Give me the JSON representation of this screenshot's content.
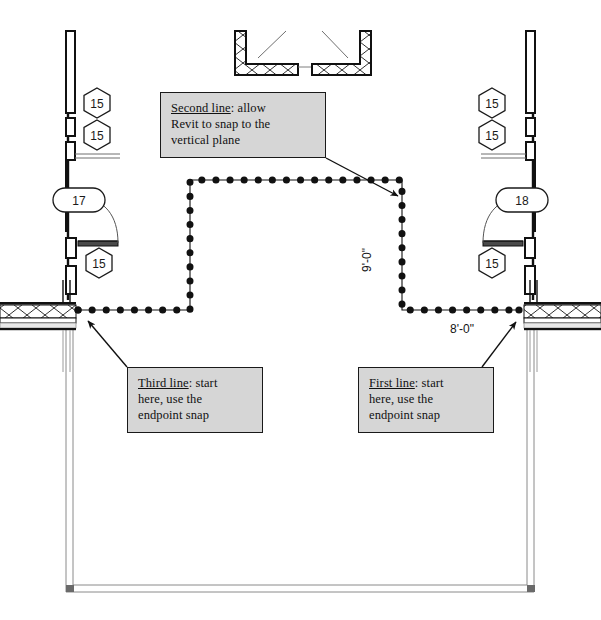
{
  "document": {
    "kind": "architectural-floor-plan-sketch",
    "background_color": "#ffffff",
    "ink_color": "#1a1a1a"
  },
  "callouts": [
    {
      "id": "second-line",
      "lead": "Second line",
      "rest": ": allow",
      "line2": "Revit to snap to the",
      "line3": "vertical plane",
      "fill": "#d6d6d6",
      "border": "#1a1a1a"
    },
    {
      "id": "third-line",
      "lead": "Third line",
      "rest": ": start",
      "line2": "here, use the",
      "line3": "endpoint snap",
      "fill": "#d6d6d6",
      "border": "#1a1a1a"
    },
    {
      "id": "first-line",
      "lead": "First line",
      "rest": ": start",
      "line2": "here, use the",
      "line3": "endpoint snap",
      "fill": "#d6d6d6",
      "border": "#1a1a1a"
    }
  ],
  "dimensions": {
    "vertical": "9'-0\"",
    "horizontal": "8'-0\""
  },
  "tags": {
    "hex_left_upper": "15",
    "hex_left_lower": "15",
    "hex_left_door": "15",
    "hex_right_upper": "15",
    "hex_right_lower": "15",
    "hex_right_door": "15",
    "oval_left": "17",
    "oval_right": "18"
  },
  "sketch_path": {
    "description": "dotted-magenta-style sketch line drawn as three segments",
    "dot_color": "#111111",
    "segments": [
      {
        "name": "first-line",
        "from": [
          519,
          310
        ],
        "to": [
          402,
          310
        ]
      },
      {
        "name": "second-line",
        "from": [
          402,
          310
        ],
        "to": [
          402,
          180
        ]
      },
      {
        "name": "third-line",
        "from": [
          402,
          180
        ],
        "to": [
          190,
          180
        ]
      },
      {
        "name": "third-line-down",
        "from": [
          190,
          180
        ],
        "to": [
          190,
          310
        ]
      },
      {
        "name": "third-line-left",
        "from": [
          190,
          310
        ],
        "to": [
          78,
          310
        ]
      }
    ]
  }
}
